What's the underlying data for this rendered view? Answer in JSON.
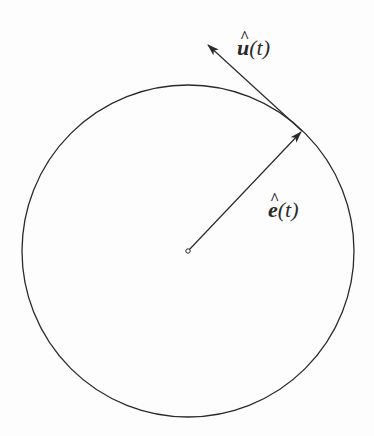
{
  "figure": {
    "colors": {
      "background": "#fdfdfd",
      "stroke": "#2a2a2a"
    },
    "circle": {
      "cx": 188,
      "cy": 251,
      "r": 166
    },
    "center_point": {
      "x": 188,
      "y": 251
    },
    "vectors": [
      {
        "id": "e",
        "name": "radial unit vector",
        "from": [
          188,
          251
        ],
        "to": [
          302,
          131
        ],
        "label": {
          "vector": "e",
          "hat": "^",
          "argument": "(t)",
          "full": "ê(t)",
          "x": 268,
          "y": 217
        }
      },
      {
        "id": "u",
        "name": "tangent unit vector",
        "from": [
          302,
          131
        ],
        "to": [
          207,
          44
        ],
        "label": {
          "vector": "u",
          "hat": "^",
          "argument": "(t)",
          "full": "û(t)",
          "x": 237,
          "y": 55
        }
      }
    ]
  }
}
